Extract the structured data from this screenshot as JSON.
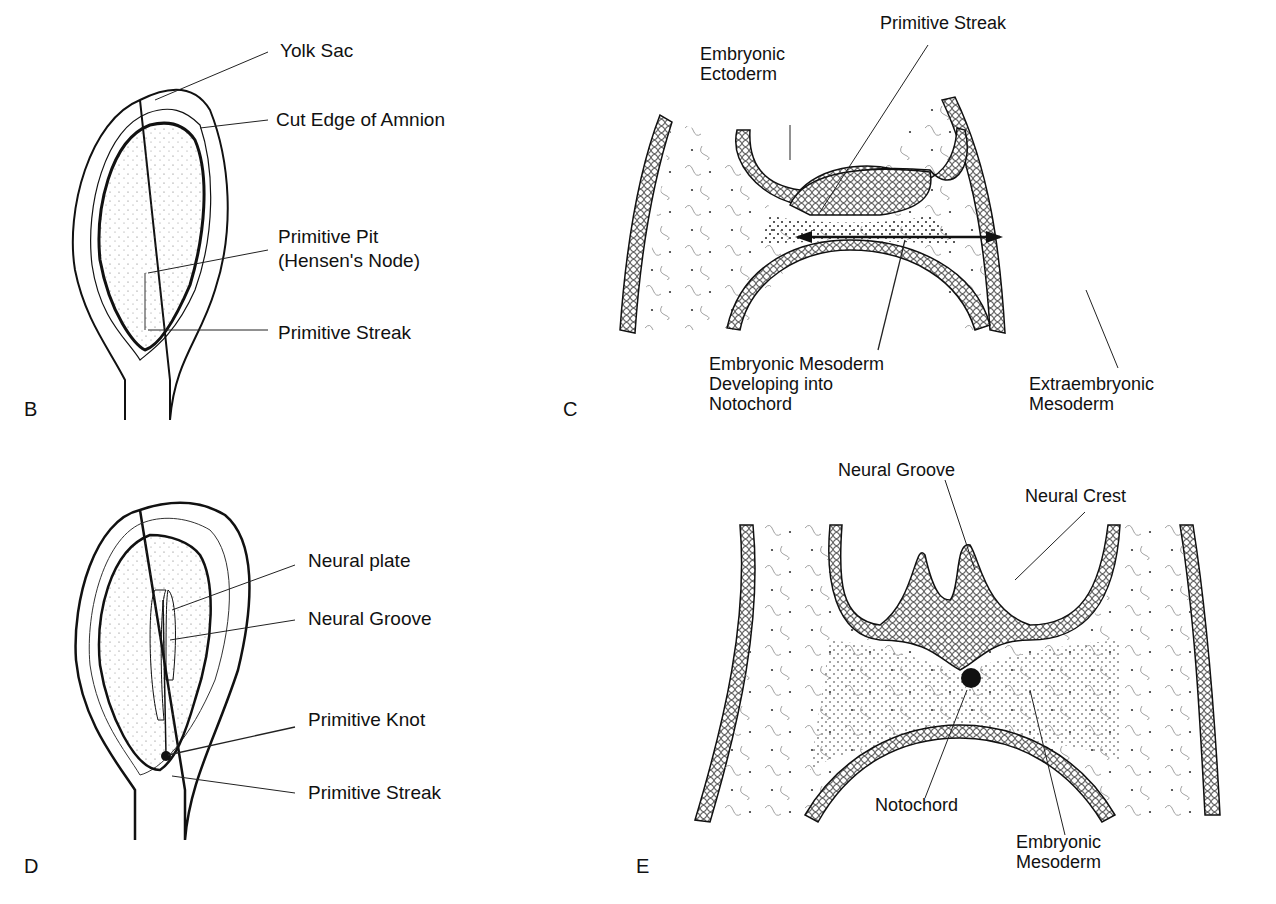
{
  "figure": {
    "panels": [
      {
        "id": "B",
        "letter": "B",
        "labels": [
          "Yolk Sac",
          "Cut Edge of Amnion",
          "Primitive Pit",
          "(Hensen's Node)",
          "Primitive Streak"
        ]
      },
      {
        "id": "C",
        "letter": "C",
        "labels": [
          "Primitive Streak",
          "Embryonic",
          "Ectoderm",
          "Embryonic Mesoderm",
          "Developing into",
          "Notochord",
          "Extraembryonic",
          "Mesoderm"
        ]
      },
      {
        "id": "D",
        "letter": "D",
        "labels": [
          "Neural plate",
          "Neural Groove",
          "Primitive Knot",
          "Primitive Streak"
        ]
      },
      {
        "id": "E",
        "letter": "E",
        "labels": [
          "Neural Groove",
          "Neural Crest",
          "Notochord",
          "Embryonic",
          "Mesoderm"
        ]
      }
    ]
  },
  "colors": {
    "ink": "#111111",
    "background": "#ffffff"
  }
}
